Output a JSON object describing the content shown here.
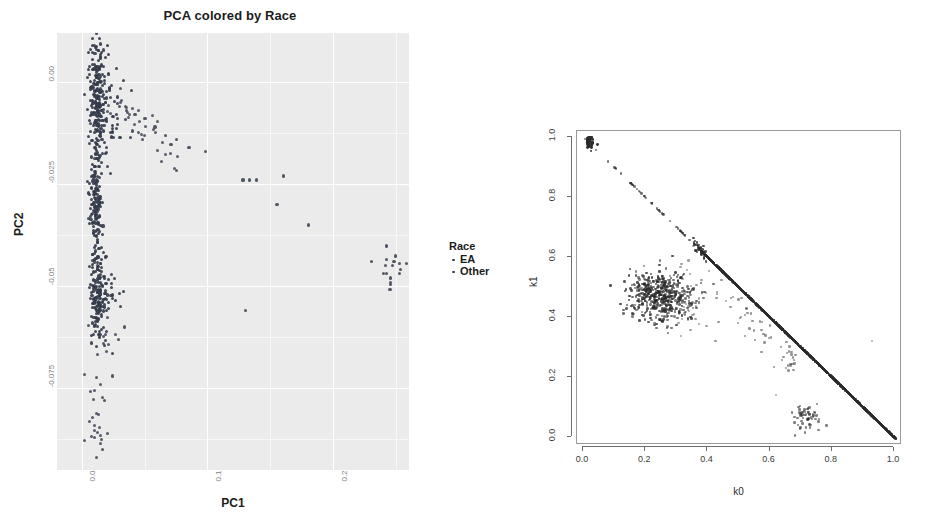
{
  "figure": {
    "layout": "two-panel side-by-side scatter figure"
  },
  "left_chart": {
    "title": "PCA colored by Race",
    "xlabel": "PC1",
    "ylabel": "PC2",
    "xticks": [
      "0.0",
      "0.1",
      "0.2"
    ],
    "yticks": [
      "0.00",
      "-0.025",
      "-0.05",
      "-0.075"
    ],
    "legend": {
      "title": "Race",
      "items": [
        "EA",
        "Other"
      ]
    }
  },
  "right_chart": {
    "xlabel": "k0",
    "ylabel": "k1",
    "xticks": [
      "0.0",
      "0.2",
      "0.4",
      "0.6",
      "0.8",
      "1.0"
    ],
    "yticks": [
      "0.0",
      "0.2",
      "0.4",
      "0.6",
      "0.8",
      "1.0"
    ]
  },
  "chart_data": [
    {
      "type": "scatter",
      "id": "pca-race",
      "title": "PCA colored by Race",
      "xlabel": "PC1",
      "ylabel": "PC2",
      "xlim": [
        -0.02,
        0.26
      ],
      "ylim": [
        -0.095,
        0.012
      ],
      "xticks": [
        0.0,
        0.1,
        0.2
      ],
      "xticklabels": [
        "0.0",
        "0.1",
        "0.2"
      ],
      "yticks": [
        0.0,
        -0.025,
        -0.05,
        -0.075
      ],
      "yticklabels": [
        "0.00",
        "-0.025",
        "-0.05",
        "-0.075"
      ],
      "grid": true,
      "legend": {
        "title": "Race",
        "position": "right",
        "entries": [
          {
            "name": "EA",
            "color": "#353c4b"
          },
          {
            "name": "Other",
            "color": "#4a4f5e"
          }
        ]
      },
      "series": [
        {
          "name": "EA",
          "color": "#353c4b",
          "description": "dense vertical clusters near PC1 ~ 0.01",
          "clusters": [
            {
              "cx": 0.012,
              "cy": -0.004,
              "sx": 0.006,
              "sy": 0.007,
              "n": 260
            },
            {
              "cx": 0.011,
              "cy": -0.03,
              "sx": 0.004,
              "sy": 0.005,
              "n": 130
            },
            {
              "cx": 0.012,
              "cy": -0.052,
              "sx": 0.005,
              "sy": 0.006,
              "n": 190
            }
          ]
        },
        {
          "name": "Other",
          "color": "#4a4f5e",
          "description": "admixture arc and isolated points extending toward larger PC1",
          "points": [
            [
              0.03,
              -0.006
            ],
            [
              0.035,
              -0.007
            ],
            [
              0.042,
              -0.008
            ],
            [
              0.05,
              -0.009
            ],
            [
              0.058,
              -0.011
            ],
            [
              0.066,
              -0.013
            ],
            [
              0.048,
              -0.014
            ],
            [
              0.04,
              -0.012
            ],
            [
              0.075,
              -0.014
            ],
            [
              0.085,
              -0.016
            ],
            [
              0.098,
              -0.017
            ],
            [
              0.128,
              -0.024
            ],
            [
              0.133,
              -0.024
            ],
            [
              0.139,
              -0.024
            ],
            [
              0.16,
              -0.023
            ],
            [
              0.155,
              -0.03
            ],
            [
              0.18,
              -0.035
            ],
            [
              0.13,
              -0.056
            ],
            [
              0.23,
              -0.044
            ],
            [
              0.241,
              -0.045
            ],
            [
              0.248,
              -0.044
            ],
            [
              0.253,
              -0.046
            ],
            [
              0.245,
              -0.048
            ],
            [
              0.034,
              -0.06
            ],
            [
              0.029,
              -0.063
            ],
            [
              0.024,
              -0.072
            ],
            [
              0.018,
              -0.078
            ],
            [
              0.02,
              -0.086
            ],
            [
              0.016,
              -0.09
            ]
          ]
        }
      ]
    },
    {
      "type": "scatter",
      "id": "admixture-k0-k1",
      "xlabel": "k0",
      "ylabel": "k1",
      "xlim": [
        0.0,
        1.0
      ],
      "ylim": [
        0.0,
        1.0
      ],
      "xticks": [
        0.0,
        0.2,
        0.4,
        0.6,
        0.8,
        1.0
      ],
      "xticklabels": [
        "0.0",
        "0.2",
        "0.4",
        "0.6",
        "0.8",
        "1.0"
      ],
      "yticks": [
        0.0,
        0.2,
        0.4,
        0.6,
        0.8,
        1.0
      ],
      "yticklabels": [
        "0.0",
        "0.2",
        "0.4",
        "0.6",
        "0.8",
        "1.0"
      ],
      "grid": false,
      "structures": [
        {
          "name": "unrelated-diagonal",
          "description": "dense band along k0 + k1 = 1 from (0.38,0.62) to (1.0,0.0)",
          "n": 1400
        },
        {
          "name": "sparse-upper-diagonal",
          "description": "sparse points along k0 + k1 = 1 from (0.0,1.0) to (0.38,0.62)",
          "n": 45
        },
        {
          "name": "mz-twin-cluster",
          "description": "tight cluster at k0 ~ 0.01, k1 ~ 0.99",
          "cx": 0.01,
          "cy": 0.985,
          "n": 40
        },
        {
          "name": "full-sib-blob",
          "description": "diffuse blob centred near k0 ~ 0.25, k1 ~ 0.47",
          "cx": 0.25,
          "cy": 0.47,
          "sx": 0.055,
          "sy": 0.045,
          "n": 420
        },
        {
          "name": "second-degree-cluster",
          "description": "small cluster near k0 ~ 0.72, k1 ~ 0.06",
          "cx": 0.72,
          "cy": 0.06,
          "n": 55
        }
      ]
    }
  ]
}
